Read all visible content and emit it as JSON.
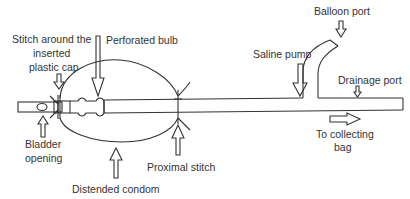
{
  "diagram": {
    "type": "labeled-schematic",
    "colors": {
      "line": "#333333",
      "background": "#ffffff",
      "text": "#333333"
    },
    "labels": {
      "stitch_cap_line1": "Stitch around the",
      "stitch_cap_line2": "inserted",
      "stitch_cap_line3": "plastic cap",
      "perforated_bulb": "Perforated bulb",
      "saline_pump": "Saline pump",
      "balloon_port": "Balloon port",
      "drainage_port": "Drainage port",
      "bladder_opening_line1": "Bladder",
      "bladder_opening_line2": "opening",
      "distended_condom": "Distended condom",
      "proximal_stitch": "Proximal stitch",
      "collecting_bag_line1": "To collecting",
      "collecting_bag_line2": "bag"
    }
  }
}
